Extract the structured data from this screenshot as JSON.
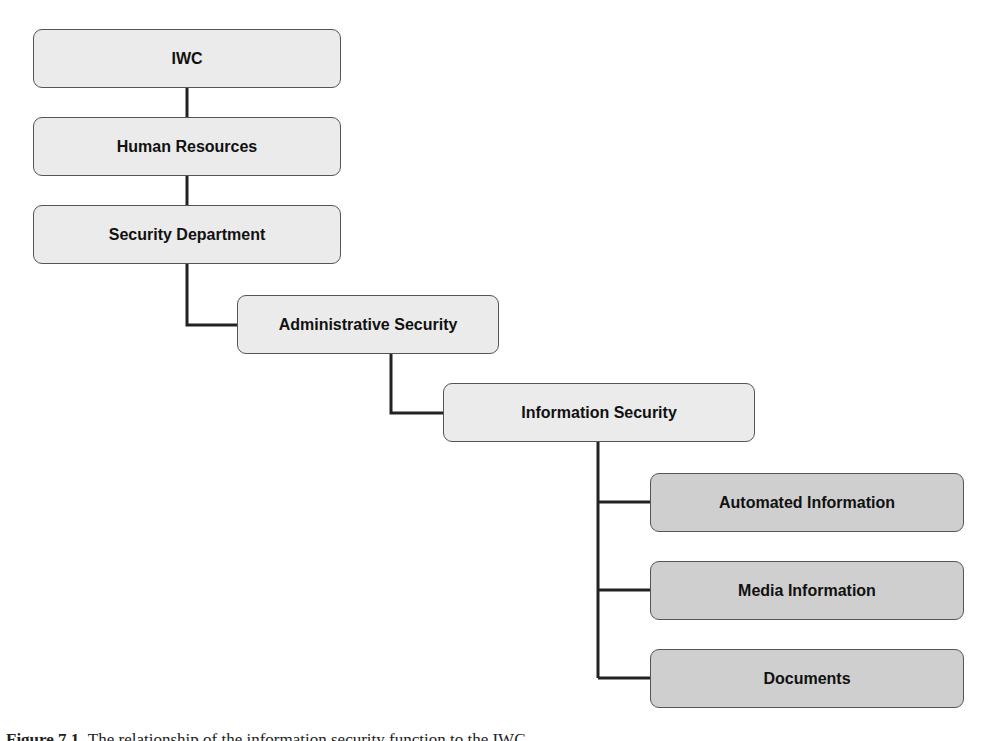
{
  "diagram": {
    "type": "hierarchy",
    "nodes": [
      {
        "id": "iwc",
        "label": "IWC",
        "level": 0
      },
      {
        "id": "hr",
        "label": "Human Resources",
        "level": 1
      },
      {
        "id": "secdept",
        "label": "Security Department",
        "level": 2
      },
      {
        "id": "adminsec",
        "label": "Administrative Security",
        "level": 3
      },
      {
        "id": "infosec",
        "label": "Information Security",
        "level": 4
      },
      {
        "id": "autoinfo",
        "label": "Automated Information",
        "level": 5
      },
      {
        "id": "mediainfo",
        "label": "Media Information",
        "level": 5
      },
      {
        "id": "docs",
        "label": "Documents",
        "level": 5
      }
    ],
    "edges": [
      [
        "iwc",
        "hr"
      ],
      [
        "hr",
        "secdept"
      ],
      [
        "secdept",
        "adminsec"
      ],
      [
        "adminsec",
        "infosec"
      ],
      [
        "infosec",
        "autoinfo"
      ],
      [
        "infosec",
        "mediainfo"
      ],
      [
        "infosec",
        "docs"
      ]
    ],
    "colors": {
      "node_fill": "#ebebeb",
      "leaf_fill": "#cfcfcf",
      "border": "#555555",
      "line": "#222222"
    }
  },
  "caption": {
    "prefix": "Figure 7.1",
    "text": "The relationship of the information security function to the IWC."
  }
}
